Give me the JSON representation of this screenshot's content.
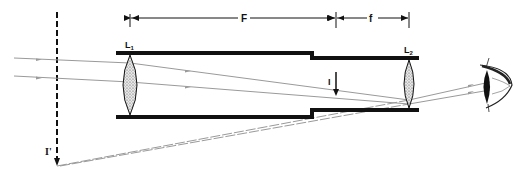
{
  "diagram": {
    "type": "optical-ray-diagram",
    "labels": {
      "objective_lens": "L",
      "objective_lens_sub": "1",
      "eyepiece_lens": "L",
      "eyepiece_lens_sub": "2",
      "objective_focal_length": "F",
      "eyepiece_focal_length": "f",
      "intermediate_image": "I",
      "virtual_image": "I'"
    },
    "colors": {
      "tube": "#111111",
      "rays": "#9a9a9a",
      "lens_fill": "#d8d8d8",
      "ink": "#111111"
    }
  }
}
